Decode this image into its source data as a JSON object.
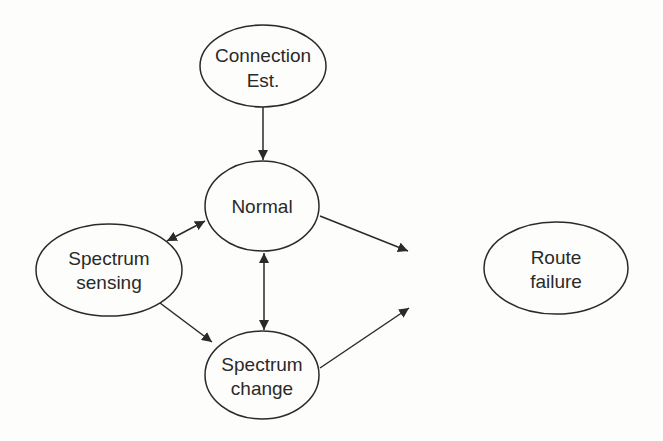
{
  "diagram": {
    "type": "state-transition",
    "nodes": [
      {
        "id": "connection",
        "lines": [
          "Connection",
          "Est."
        ]
      },
      {
        "id": "normal",
        "lines": [
          "Normal"
        ]
      },
      {
        "id": "sensing",
        "lines": [
          "Spectrum",
          "sensing"
        ]
      },
      {
        "id": "route",
        "lines": [
          "Route",
          "failure"
        ]
      },
      {
        "id": "change",
        "lines": [
          "Spectrum",
          "change"
        ]
      }
    ],
    "edges": [
      {
        "from": "Connection Est.",
        "to": "Normal",
        "direction": "one-way"
      },
      {
        "from": "Normal",
        "to": "Spectrum sensing",
        "direction": "bidirectional"
      },
      {
        "from": "Normal",
        "to": "Route failure",
        "direction": "one-way"
      },
      {
        "from": "Normal",
        "to": "Spectrum change",
        "direction": "bidirectional"
      },
      {
        "from": "Spectrum sensing",
        "to": "Spectrum change",
        "direction": "one-way"
      },
      {
        "from": "Spectrum change",
        "to": "Route failure",
        "direction": "one-way"
      }
    ]
  }
}
